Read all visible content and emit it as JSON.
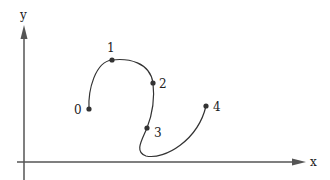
{
  "diagram": {
    "axes": {
      "x_label": "x",
      "y_label": "y",
      "color": "#555555"
    },
    "curve_color": "#333333",
    "points": [
      {
        "label": "0",
        "x": 89,
        "y": 109
      },
      {
        "label": "1",
        "x": 112,
        "y": 60
      },
      {
        "label": "2",
        "x": 153,
        "y": 83
      },
      {
        "label": "3",
        "x": 147,
        "y": 128
      },
      {
        "label": "4",
        "x": 206,
        "y": 106
      }
    ]
  }
}
